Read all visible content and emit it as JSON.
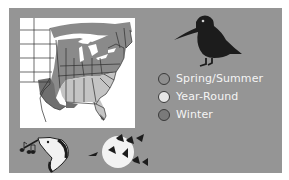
{
  "figure": {
    "background_color": "#959595",
    "map": {
      "region": "Eastern United States",
      "colors": {
        "outside_range": "#ffffff",
        "spring_summer": "#8a8a8a",
        "year_round": "#c4c4c4",
        "winter": "#6f6f6f",
        "borders": "#2e2e2e"
      }
    },
    "legend": {
      "items": [
        {
          "label": "Spring/Summer",
          "color": "#8f8f8f"
        },
        {
          "label": "Year-Round",
          "color": "#e6e6e6"
        },
        {
          "label": "Winter",
          "color": "#7a7a7a"
        }
      ]
    },
    "illustrations": {
      "main": "woodcock-silhouette",
      "bottom_left": "woodcock-head-with-music-notes",
      "bottom_right": "birds-flying-across-moon"
    }
  }
}
